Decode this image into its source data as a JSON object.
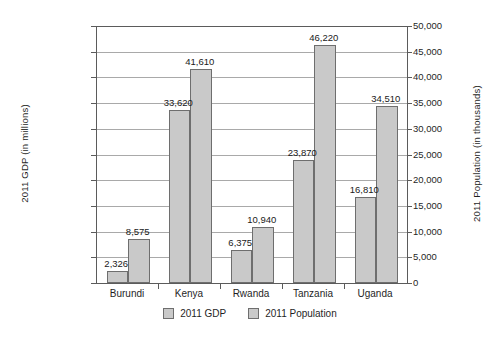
{
  "chart_data": {
    "type": "bar",
    "title": "",
    "subtitle": "",
    "xlabel": "",
    "ylabel": "2011 GDP (in millions)",
    "y2label": "2011 Population (in thousands)",
    "categories": [
      "Burundi",
      "Kenya",
      "Rwanda",
      "Tanzania",
      "Uganda"
    ],
    "series": [
      {
        "name": "2011 GDP",
        "axis": "left",
        "values": [
          2326,
          33620,
          6375,
          23870,
          16810
        ],
        "value_labels": [
          "2,326",
          "33,620",
          "6,375",
          "23,870",
          "16,810"
        ]
      },
      {
        "name": "2011 Population",
        "axis": "right",
        "values": [
          8575,
          41610,
          10940,
          46220,
          34510
        ],
        "value_labels": [
          "8,575",
          "41,610",
          "10,940",
          "46,220",
          "34,510"
        ]
      }
    ],
    "ylim": [
      0,
      50000
    ],
    "y2lim": [
      0,
      50000
    ],
    "ytick_labels": [
      "$50,000",
      "$45,000",
      "$40,000",
      "$35,000",
      "$30,000",
      "$25,000",
      "$20,000",
      "$15,000",
      "$10,000",
      "$5,000",
      "$0"
    ],
    "ytick_values": [
      50000,
      45000,
      40000,
      35000,
      30000,
      25000,
      20000,
      15000,
      10000,
      5000,
      0
    ],
    "y2tick_labels": [
      "50,000",
      "45,000",
      "40,000",
      "35,000",
      "30,000",
      "25,000",
      "20,000",
      "15,000",
      "10,000",
      "5,000",
      "0"
    ],
    "y2tick_values": [
      50000,
      45000,
      40000,
      35000,
      30000,
      25000,
      20000,
      15000,
      10000,
      5000,
      0
    ],
    "grid": true,
    "legend_position": "bottom",
    "legend": [
      "2011 GDP",
      "2011 Population"
    ],
    "colors": {
      "bar_fill": "#c9c9c9",
      "bar_border": "#6e6e6e",
      "gridline": "#a9a9a9",
      "axis": "#5b5b5b",
      "background": "#ffffff",
      "text": "#1f1f1f"
    }
  }
}
